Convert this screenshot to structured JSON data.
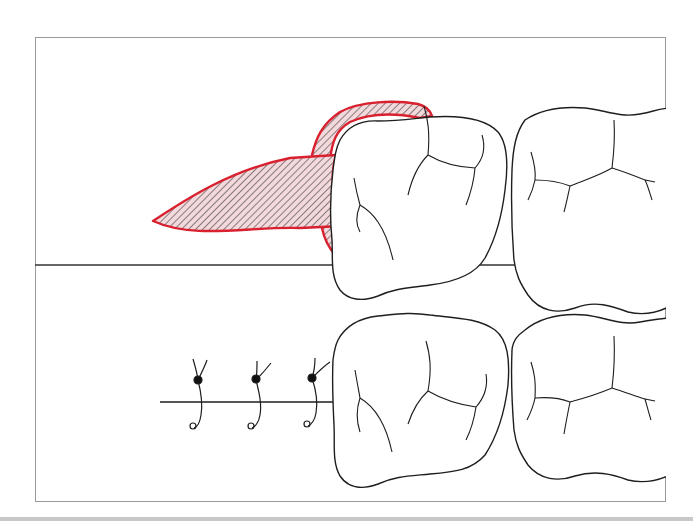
{
  "figure": {
    "title": "Dental flap surgery illustration",
    "panels": [
      {
        "id": "top",
        "description": "Triangular flap reflected distal to molar",
        "elements": [
          "flap",
          "molar-1",
          "molar-2"
        ]
      },
      {
        "id": "bottom",
        "description": "Flap closed with interrupted sutures",
        "elements": [
          "incision-line",
          "suture-1",
          "suture-2",
          "suture-3",
          "molar-1",
          "molar-2"
        ]
      }
    ],
    "suture_count": 3
  },
  "colors": {
    "flap_outline": "#d8202e",
    "flap_fill": "#f4d9dc",
    "hatch": "#3a3a3a",
    "tooth_outline": "#1e1e1e",
    "frame_border": "#9a9a9a",
    "background": "#ffffff"
  }
}
